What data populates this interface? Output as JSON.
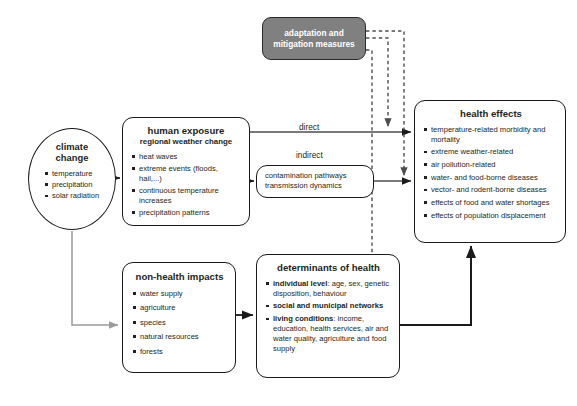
{
  "diagram": {
    "background": "#ffffff",
    "colors": {
      "line_black": "#1a1a1a",
      "line_gray": "#9b9b9b",
      "adaptation_fill": "#808080",
      "adaptation_text": "#ffffff",
      "text": "#231f20"
    }
  },
  "nodes": {
    "climate_change": {
      "title": "climate\nchange",
      "title_line1": "climate",
      "title_line2": "change",
      "shape": "ellipse",
      "items": [
        "temperature",
        "precipitation",
        "solar radiation"
      ]
    },
    "human_exposure": {
      "title": "human exposure",
      "subtitle": "regional weather change",
      "shape": "rounded-rect",
      "items": [
        "heat waves",
        "extreme events (floods, hail,...)",
        "continuous temperature increases",
        "precipitation patterns"
      ]
    },
    "contamination": {
      "shape": "rounded-rect",
      "line1": "contamination pathways",
      "line2": "transmission dynamics"
    },
    "adaptation": {
      "title_line1": "adaptation and",
      "title_line2": "mitigation measures",
      "shape": "rounded-rect-filled"
    },
    "health_effects": {
      "title": "health effects",
      "shape": "rounded-rect",
      "items": [
        "temperature-related morbidity and mortality",
        "extreme weather-related",
        "air pollution-related",
        "water- and food-borne diseases",
        "vector- and rodent-borne diseases",
        "effects of food and water shortages",
        "effects of population displacement"
      ]
    },
    "non_health_impacts": {
      "title": "non-health impacts",
      "shape": "rounded-rect",
      "items": [
        "water supply",
        "agriculture",
        "species",
        "natural resources",
        "forests"
      ]
    },
    "determinants": {
      "title": "determinants of health",
      "shape": "rounded-rect",
      "items": [
        {
          "lead": "individual level",
          "rest": ": age, sex, genetic disposition, behaviour"
        },
        {
          "lead": "social and municipal networks",
          "rest": ""
        },
        {
          "lead": "living conditions",
          "rest": ": income, education, health services, air and water quality, agriculture and food supply"
        }
      ]
    }
  },
  "edges": {
    "direct_label": "direct",
    "indirect_label": "indirect"
  }
}
